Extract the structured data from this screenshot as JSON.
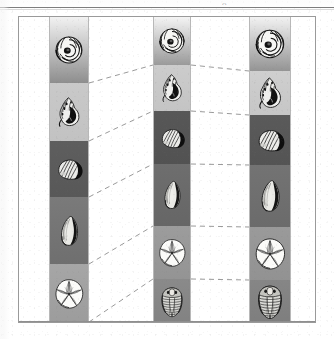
{
  "figure": {
    "kind": "scientific-plate",
    "top_rule_glyph": "o",
    "background_color": "#ffffff",
    "frame_color": "#9a9a9a",
    "dash_color": "#9a9a9a",
    "column_divider_color": "#b8b8b8"
  },
  "columns": [
    {
      "id": "column-1",
      "name": "left-column",
      "x": 30,
      "width": 40,
      "bands": [
        {
          "name": "band-ammonite",
          "specimen": "ammonite-shell",
          "top": 0,
          "height": 66,
          "tone_top": "#f2f2f2",
          "tone_bottom": "#8e8e8e"
        },
        {
          "name": "band-conch",
          "specimen": "conch-gastropod",
          "top": 66,
          "height": 58,
          "tone_top": "#c9c9c9",
          "tone_bottom": "#c2c2c2"
        },
        {
          "name": "band-clam",
          "specimen": "clam-bivalve",
          "top": 124,
          "height": 56,
          "tone_top": "#5e5e5e",
          "tone_bottom": "#585858"
        },
        {
          "name": "band-mussel",
          "specimen": "curved-bivalve",
          "top": 180,
          "height": 67,
          "tone_top": "#7a7a7a",
          "tone_bottom": "#6f6f6f"
        },
        {
          "name": "band-sanddollar",
          "specimen": "sand-dollar-urchin",
          "top": 247,
          "height": 60,
          "tone_top": "#a6a6a6",
          "tone_bottom": "#9c9c9c"
        }
      ]
    },
    {
      "id": "column-2",
      "name": "middle-column",
      "x": 134,
      "width": 38,
      "bands": [
        {
          "name": "band-ammonite",
          "specimen": "ammonite-shell",
          "top": 0,
          "height": 48,
          "tone_top": "#f4f4f4",
          "tone_bottom": "#9a9a9a"
        },
        {
          "name": "band-conch",
          "specimen": "conch-gastropod",
          "top": 48,
          "height": 46,
          "tone_top": "#cccccc",
          "tone_bottom": "#c4c4c4"
        },
        {
          "name": "band-clam",
          "specimen": "clam-bivalve",
          "top": 94,
          "height": 53,
          "tone_top": "#575757",
          "tone_bottom": "#525252"
        },
        {
          "name": "band-mussel",
          "specimen": "curved-bivalve",
          "top": 147,
          "height": 62,
          "tone_top": "#6e6e6e",
          "tone_bottom": "#666666"
        },
        {
          "name": "band-sanddollar",
          "specimen": "sand-dollar-urchin",
          "top": 209,
          "height": 53,
          "tone_top": "#9c9c9c",
          "tone_bottom": "#949494"
        },
        {
          "name": "band-trilobite",
          "specimen": "trilobite",
          "top": 262,
          "height": 45,
          "tone_top": "#8a8a8a",
          "tone_bottom": "#828282"
        }
      ]
    },
    {
      "id": "column-3",
      "name": "right-column",
      "x": 230,
      "width": 42,
      "bands": [
        {
          "name": "band-ammonite",
          "specimen": "ammonite-shell",
          "top": 0,
          "height": 54,
          "tone_top": "#f2f2f2",
          "tone_bottom": "#949494"
        },
        {
          "name": "band-conch",
          "specimen": "conch-gastropod",
          "top": 54,
          "height": 44,
          "tone_top": "#cfcfcf",
          "tone_bottom": "#c6c6c6"
        },
        {
          "name": "band-clam",
          "specimen": "clam-bivalve",
          "top": 98,
          "height": 50,
          "tone_top": "#5a5a5a",
          "tone_bottom": "#545454"
        },
        {
          "name": "band-mussel",
          "specimen": "curved-bivalve",
          "top": 148,
          "height": 62,
          "tone_top": "#737373",
          "tone_bottom": "#6b6b6b"
        },
        {
          "name": "band-sanddollar",
          "specimen": "sand-dollar-urchin",
          "top": 210,
          "height": 53,
          "tone_top": "#9a9a9a",
          "tone_bottom": "#929292"
        },
        {
          "name": "band-trilobite",
          "specimen": "trilobite",
          "top": 263,
          "height": 44,
          "tone_top": "#868686",
          "tone_bottom": "#7e7e7e"
        }
      ]
    }
  ],
  "connectors": [
    {
      "name": "link-1-a",
      "from": [
        70,
        66
      ],
      "to": [
        134,
        48
      ]
    },
    {
      "name": "link-1-b",
      "from": [
        70,
        124
      ],
      "to": [
        134,
        94
      ]
    },
    {
      "name": "link-1-c",
      "from": [
        70,
        180
      ],
      "to": [
        134,
        147
      ]
    },
    {
      "name": "link-1-d",
      "from": [
        70,
        247
      ],
      "to": [
        134,
        209
      ]
    },
    {
      "name": "link-1-e",
      "from": [
        70,
        305
      ],
      "to": [
        134,
        262
      ]
    },
    {
      "name": "link-2-a",
      "from": [
        172,
        48
      ],
      "to": [
        230,
        54
      ]
    },
    {
      "name": "link-2-b",
      "from": [
        172,
        94
      ],
      "to": [
        230,
        98
      ]
    },
    {
      "name": "link-2-c",
      "from": [
        172,
        147
      ],
      "to": [
        230,
        148
      ]
    },
    {
      "name": "link-2-d",
      "from": [
        172,
        209
      ],
      "to": [
        230,
        210
      ]
    },
    {
      "name": "link-2-e",
      "from": [
        172,
        262
      ],
      "to": [
        230,
        263
      ]
    }
  ]
}
